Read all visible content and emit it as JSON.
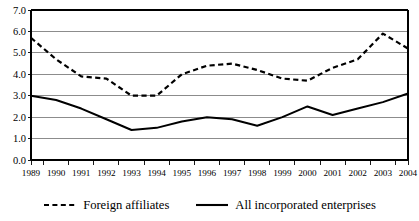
{
  "chart_data": {
    "type": "line",
    "title": "",
    "subtitle": "",
    "xlabel": "",
    "ylabel": "",
    "grid": true,
    "grid_axis": "y",
    "legend_position": "bottom",
    "xlim": [
      "1989",
      "2004"
    ],
    "ylim": [
      0.0,
      7.0
    ],
    "ytick_step": 1.0,
    "categories": [
      "1989",
      "1990",
      "1991",
      "1992",
      "1993",
      "1994",
      "1995",
      "1996",
      "1997",
      "1998",
      "1999",
      "2000",
      "2001",
      "2002",
      "2003",
      "2004"
    ],
    "ytick_labels": [
      "0.0",
      "1.0",
      "2.0",
      "3.0",
      "4.0",
      "5.0",
      "6.0",
      "7.0"
    ],
    "series": [
      {
        "name": "Foreign affiliates",
        "style": "dashed",
        "color": "#000000",
        "values": [
          5.7,
          4.7,
          3.9,
          3.8,
          3.0,
          3.0,
          4.0,
          4.4,
          4.5,
          4.2,
          3.8,
          3.7,
          4.3,
          4.7,
          5.9,
          5.2
        ]
      },
      {
        "name": "All incorporated enterprises",
        "style": "solid",
        "color": "#000000",
        "values": [
          3.0,
          2.8,
          2.4,
          1.9,
          1.4,
          1.5,
          1.8,
          2.0,
          1.9,
          1.6,
          2.0,
          2.5,
          2.1,
          2.4,
          2.7,
          3.1
        ]
      }
    ]
  },
  "legend": {
    "items": [
      {
        "label": "Foreign affiliates",
        "style": "dashed"
      },
      {
        "label": "All incorporated enterprises",
        "style": "solid"
      }
    ]
  },
  "colors": {
    "axis": "#000000",
    "gridline": "#808080",
    "series_line": "#000000",
    "background": "#ffffff"
  }
}
